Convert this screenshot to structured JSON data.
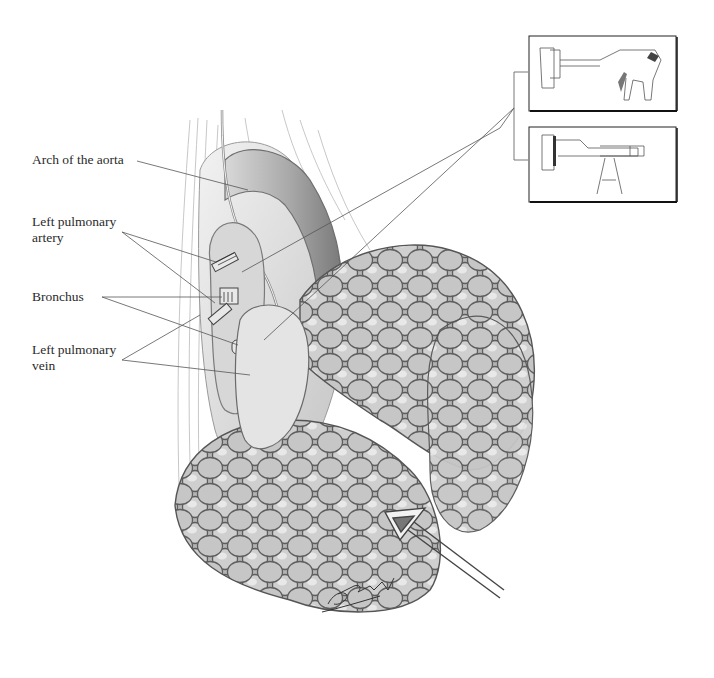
{
  "figure": {
    "type": "anatomical-illustration",
    "labels": [
      {
        "id": "aorta",
        "text_lines": [
          "Arch of the aorta"
        ]
      },
      {
        "id": "artery",
        "text_lines": [
          "Left pulmonary",
          "artery"
        ]
      },
      {
        "id": "bronchus",
        "text_lines": [
          "Bronchus"
        ]
      },
      {
        "id": "vein",
        "text_lines": [
          "Left pulmonary",
          "vein"
        ]
      }
    ],
    "insets": [
      {
        "id": "stapler-1",
        "description": "Articulating endoscopic stapler"
      },
      {
        "id": "stapler-2",
        "description": "Linear TA-type stapler"
      }
    ],
    "signature": "Dobrachi"
  },
  "colors": {
    "ink": "#3a3a3a",
    "shade_dark": "#8c8c8c",
    "shade_mid": "#b5b5b5",
    "shade_light": "#dcdcdc",
    "background": "#ffffff"
  }
}
